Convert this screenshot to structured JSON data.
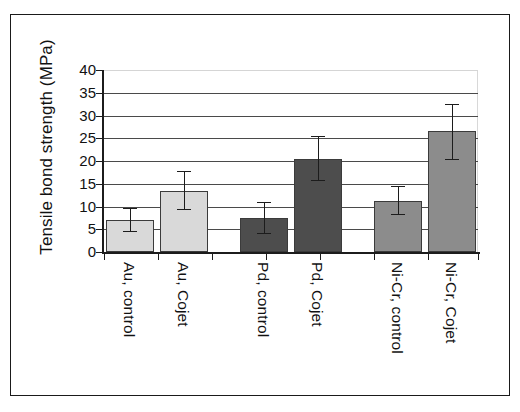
{
  "figure": {
    "frame": true,
    "background": "#ffffff"
  },
  "chart_data": {
    "type": "bar",
    "title": "",
    "xlabel": "",
    "ylabel": "Tensile bond strength (MPa)",
    "categories": [
      "Au, control",
      "Au, Cojet",
      "Pd, control",
      "Pd, Cojet",
      "Ni-Cr, control",
      "Ni-Cr, Cojet"
    ],
    "values": [
      7.0,
      13.5,
      7.5,
      20.5,
      11.3,
      26.5
    ],
    "error_upper": [
      2.7,
      4.2,
      3.5,
      5.0,
      3.2,
      6.0
    ],
    "error_lower": [
      2.7,
      4.2,
      3.5,
      5.0,
      3.2,
      6.3
    ],
    "bar_colors": [
      "#d9d9d9",
      "#d9d9d9",
      "#4d4d4d",
      "#4d4d4d",
      "#8c8c8c",
      "#8c8c8c"
    ],
    "ylim": [
      0,
      40
    ],
    "yticks": [
      0,
      5,
      10,
      15,
      20,
      25,
      30,
      35,
      40
    ],
    "ytick_labels": [
      "0",
      "5",
      "10",
      "15",
      "20",
      "25",
      "30",
      "35",
      "40"
    ],
    "grid": true,
    "legend": "none",
    "groups": [
      {
        "name": "Au",
        "color": "#d9d9d9"
      },
      {
        "name": "Pd",
        "color": "#4d4d4d"
      },
      {
        "name": "Ni-Cr",
        "color": "#8c8c8c"
      }
    ]
  }
}
